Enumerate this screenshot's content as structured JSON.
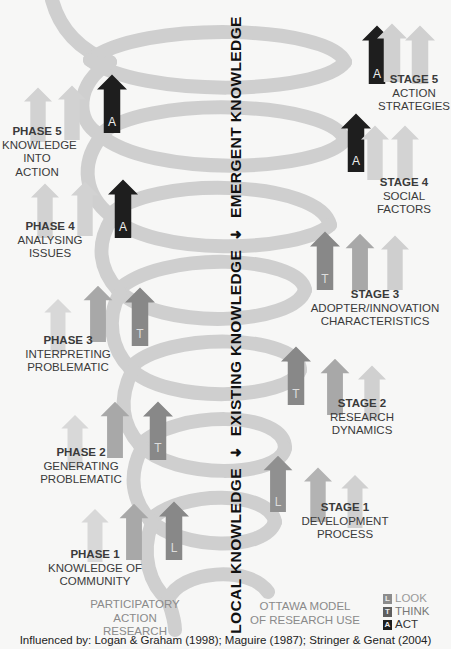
{
  "axis": {
    "segments": [
      "LOCAL KNOWLEDGE",
      "EXISTING KNOWLEDGE",
      "EMERGENT KNOWLEDGE"
    ],
    "arrow_icon": "up-arrow"
  },
  "left_model": {
    "title_lines": [
      "PARTICIPATORY",
      "ACTION",
      "RESEARCH"
    ],
    "phases": [
      {
        "heading": "PHASE 1",
        "lines": [
          "KNOWLEDGE OF",
          "COMMUNITY"
        ],
        "marker": "L"
      },
      {
        "heading": "PHASE 2",
        "lines": [
          "GENERATING",
          "PROBLEMATIC"
        ],
        "marker": "T"
      },
      {
        "heading": "PHASE 3",
        "lines": [
          "INTERPRETING",
          "PROBLEMATIC"
        ],
        "marker": "T"
      },
      {
        "heading": "PHASE 4",
        "lines": [
          "ANALYSING",
          "ISSUES"
        ],
        "marker": "A"
      },
      {
        "heading": "PHASE 5",
        "lines": [
          "KNOWLEDGE",
          "INTO ACTION"
        ],
        "marker": "A"
      }
    ]
  },
  "right_model": {
    "title_lines": [
      "OTTAWA MODEL",
      "OF RESEARCH USE"
    ],
    "stages": [
      {
        "heading": "STAGE 1",
        "lines": [
          "DEVELOPMENT",
          "PROCESS"
        ],
        "marker": "L"
      },
      {
        "heading": "STAGE 2",
        "lines": [
          "RESEARCH",
          "DYNAMICS"
        ],
        "marker": "T"
      },
      {
        "heading": "STAGE 3",
        "lines": [
          "ADOPTER/INNOVATION",
          "CHARACTERISTICS"
        ],
        "marker": "T"
      },
      {
        "heading": "STAGE 4",
        "lines": [
          "SOCIAL",
          "FACTORS"
        ],
        "marker": "A"
      },
      {
        "heading": "STAGE 5",
        "lines": [
          "ACTION",
          "STRATEGIES"
        ],
        "marker": "A"
      }
    ]
  },
  "legend": [
    {
      "key": "L",
      "label": "LOOK",
      "color": "#8c8c8c"
    },
    {
      "key": "T",
      "label": "THINK",
      "color": "#5e5e5e"
    },
    {
      "key": "A",
      "label": "ACT",
      "color": "#1e1e1e"
    }
  ],
  "colors": {
    "helix": "#cfcfcf",
    "look": "#8c8c8c",
    "think": "#7a7a7a",
    "act": "#1e1e1e",
    "ghost_light": "#d8d8d8",
    "ghost_mid": "#b5b5b5"
  },
  "footer": "Influenced by: Logan & Graham (1998); Maguire (1987); Stringer & Genat (2004)"
}
